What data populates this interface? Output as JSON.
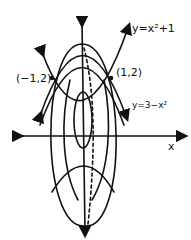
{
  "diagram": {
    "labels": {
      "curve_top": "y=x²+1",
      "curve_bottom": "y=3−x²",
      "point_left": "(−1,2)",
      "point_right": "(1,2)",
      "x_axis": "x"
    },
    "colors": {
      "ink": "#111111",
      "background": "#ffffff"
    }
  }
}
